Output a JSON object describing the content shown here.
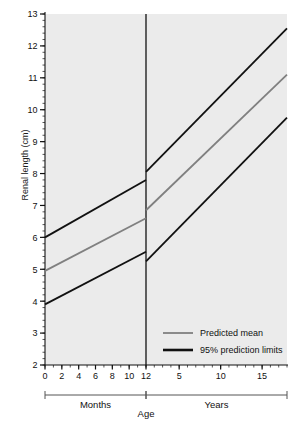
{
  "chart_data": {
    "type": "line",
    "title": "",
    "ylabel": "Renal length (cm)",
    "xlabel": "Age",
    "ylim": [
      2,
      13
    ],
    "y_ticks": [
      2,
      3,
      4,
      5,
      6,
      7,
      8,
      9,
      10,
      11,
      12,
      13
    ],
    "y_minor_tick_step": 0.2,
    "grid": false,
    "panels": [
      {
        "name": "Months",
        "label": "Months",
        "xlim": [
          0,
          12
        ],
        "x_ticks": [
          0,
          2,
          4,
          6,
          8,
          10,
          12
        ],
        "x_minor_tick_step": 1,
        "x_unit": "months"
      },
      {
        "name": "Years",
        "label": "Years",
        "xlim": [
          1,
          18
        ],
        "x_ticks": [
          5,
          10,
          15
        ],
        "x_tick_labels": [
          "5",
          "10",
          "15"
        ],
        "x_minor_tick_step": 1,
        "x_unit": "years"
      }
    ],
    "series": [
      {
        "name": "95% upper prediction limit",
        "legend": "95% prediction limits",
        "color": "#111111",
        "width": 1.8,
        "points_months": [
          {
            "x": 0,
            "y": 6.0
          },
          {
            "x": 12,
            "y": 7.8
          }
        ],
        "points_years": [
          {
            "x": 1,
            "y": 8.05
          },
          {
            "x": 18,
            "y": 12.55
          }
        ]
      },
      {
        "name": "Predicted mean",
        "legend": "Predicted mean",
        "color": "#808080",
        "width": 1.8,
        "points_months": [
          {
            "x": 0,
            "y": 4.95
          },
          {
            "x": 12,
            "y": 6.6
          }
        ],
        "points_years": [
          {
            "x": 1,
            "y": 6.85
          },
          {
            "x": 18,
            "y": 11.1
          }
        ]
      },
      {
        "name": "95% lower prediction limit",
        "legend": "95% prediction limits",
        "color": "#111111",
        "width": 1.8,
        "points_months": [
          {
            "x": 0,
            "y": 3.9
          },
          {
            "x": 12,
            "y": 5.55
          }
        ],
        "points_years": [
          {
            "x": 1,
            "y": 5.25
          },
          {
            "x": 18,
            "y": 9.75
          }
        ]
      }
    ],
    "legend": {
      "position": "inside-lower-right",
      "entries": [
        {
          "label": "Predicted mean",
          "color": "#808080",
          "width": 1.8
        },
        {
          "label": "95% prediction limits",
          "color": "#111111",
          "width": 2.6
        }
      ]
    },
    "panel_background": "#ebebeb",
    "divider": {
      "at_month": 12,
      "color": "#111111"
    }
  },
  "axis": {
    "y_label": "Renal length (cm)",
    "x_label": "Age",
    "y_tick_labels": [
      "13",
      "12",
      "11",
      "10",
      "9",
      "8",
      "7",
      "6",
      "5",
      "4",
      "3",
      "2"
    ],
    "months_tick_labels": [
      "0",
      "2",
      "4",
      "6",
      "8",
      "10",
      "12"
    ],
    "years_tick_labels": [
      "5",
      "10",
      "15"
    ],
    "bracket_months_label": "Months",
    "bracket_years_label": "Years"
  },
  "legend": {
    "mean_label": "Predicted mean",
    "limits_label": "95% prediction limits"
  }
}
